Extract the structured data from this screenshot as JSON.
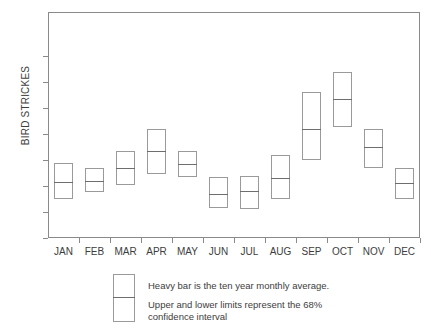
{
  "chart_data": {
    "type": "bar",
    "title": "",
    "subtitle": "",
    "xlabel": "",
    "ylabel": "BIRD STRICKES",
    "ylim": [
      0,
      78
    ],
    "yticks": [
      0,
      10,
      20,
      30,
      40,
      50,
      60,
      70
    ],
    "ytick_labels": [
      "0",
      "10",
      "20",
      "30",
      "40",
      "50",
      "60",
      "70"
    ],
    "grid": false,
    "legend_position": "below-axes",
    "categories": [
      "JAN",
      "FEB",
      "MAR",
      "APR",
      "MAY",
      "JUN",
      "JUL",
      "AUG",
      "SEP",
      "OCT",
      "NOV",
      "DEC"
    ],
    "series": [
      {
        "name": "ten year monthly average",
        "values": [
          21.5,
          22,
          27,
          33.5,
          28.5,
          17,
          18,
          23,
          42,
          53.5,
          35,
          21
        ]
      },
      {
        "name": "lower limit (68% confidence interval)",
        "values": [
          15,
          17.5,
          20.5,
          24.5,
          23.5,
          11.5,
          11,
          15,
          30,
          42.5,
          27,
          15
        ]
      },
      {
        "name": "upper limit (68% confidence interval)",
        "values": [
          29,
          27,
          33.5,
          42,
          33.5,
          23.5,
          24,
          32,
          56,
          64,
          42,
          27
        ]
      }
    ],
    "annotations": [
      "Heavy bar is the ten year monthly average.",
      "Upper and lower limits represent the 68%",
      "confidence interval"
    ]
  },
  "axes": {
    "y_label": "BIRD STRICKES",
    "y_ticks": [
      "0",
      "10",
      "20",
      "30",
      "40",
      "50",
      "60",
      "70"
    ],
    "x_ticks": [
      "JAN",
      "FEB",
      "MAR",
      "APR",
      "MAY",
      "JUN",
      "JUL",
      "AUG",
      "SEP",
      "OCT",
      "NOV",
      "DEC"
    ]
  },
  "legend": {
    "line_1": "Heavy bar is the ten year monthly average.",
    "line_2": "Upper and lower limits represent the 68%",
    "line_3": "confidence interval"
  },
  "colors": {
    "frame": "#8a8a8a",
    "bar_border": "#9a9a9a",
    "mean_line": "#6e6e6e",
    "text": "#3d3d3d",
    "background": "#ffffff"
  }
}
